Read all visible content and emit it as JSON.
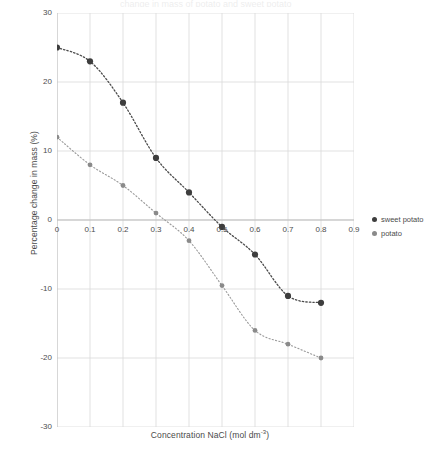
{
  "chart_data": {
    "type": "scatter",
    "title": "",
    "xlabel": "Concentration NaCl (mol dm",
    "xlabel_sup": "-3",
    "xlabel_close": ")",
    "ylabel": "Percentage change in mass (%)",
    "x": [
      0,
      0.1,
      0.2,
      0.3,
      0.4,
      0.5,
      0.6,
      0.7,
      0.8
    ],
    "xlim": [
      0,
      0.9
    ],
    "ylim": [
      -30,
      30
    ],
    "xticks": [
      "0",
      "0.1",
      "0.2",
      "0.3",
      "0.4",
      "0.5",
      "0.6",
      "0.7",
      "0.8",
      "0.9"
    ],
    "xtick_values": [
      0,
      0.1,
      0.2,
      0.3,
      0.4,
      0.5,
      0.6,
      0.7,
      0.8,
      0.9
    ],
    "yticks": [
      "30",
      "20",
      "10",
      "0",
      "-10",
      "-20",
      "-30"
    ],
    "ytick_values": [
      30,
      20,
      10,
      0,
      -10,
      -20,
      -30
    ],
    "grid": true,
    "legend_position": "right",
    "series": [
      {
        "name": "sweet potato",
        "color": "#3d3d3d",
        "marker": "circle",
        "trendline": "dotted",
        "values": [
          25,
          23,
          17,
          9,
          4,
          -1,
          -5,
          -11,
          -12
        ]
      },
      {
        "name": "potato",
        "color": "#8a8a8a",
        "marker": "circle",
        "trendline": "dotted",
        "values": [
          12,
          8,
          5,
          1,
          -3,
          -1,
          -9.5,
          -16,
          -18
        ]
      }
    ],
    "extra_points": {
      "note": "potato series has points at 0.6:-16, 0.7:-18, 0.8:-20",
      "potato_tail": [
        [
          0.5,
          -9.5
        ],
        [
          0.6,
          -16
        ],
        [
          0.7,
          -18
        ],
        [
          0.8,
          -20
        ]
      ]
    }
  },
  "legend": {
    "items": [
      {
        "label": "sweet potato",
        "color": "#3d3d3d"
      },
      {
        "label": "potato",
        "color": "#8a8a8a"
      }
    ]
  },
  "title_remnant": "change in mass of potato and sweet potato"
}
